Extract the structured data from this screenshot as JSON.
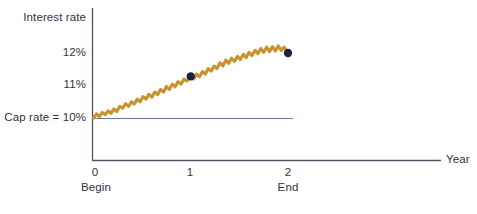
{
  "chart_data": {
    "type": "line",
    "title": "",
    "subtitle": "",
    "xlabel": "Year",
    "ylabel": "Interest rate",
    "xlim": [
      0,
      2.0
    ],
    "ylim": [
      9.4,
      12.45
    ],
    "grid": false,
    "legend_position": "none",
    "x_ticks": [
      {
        "value": 0,
        "label": "0",
        "sublabel": "Begin"
      },
      {
        "value": 1,
        "label": "1",
        "sublabel": ""
      },
      {
        "value": 2,
        "label": "2",
        "sublabel": "End"
      }
    ],
    "y_ticks": [
      {
        "value": 12,
        "label": "12%"
      },
      {
        "value": 11,
        "label": "11%"
      },
      {
        "value": 10,
        "label": "Cap rate = 10%"
      }
    ],
    "reference_lines": [
      {
        "name": "cap-rate",
        "label": "Cap rate = 10%",
        "value": 10,
        "orientation": "horizontal",
        "x_start": 0,
        "x_end": 2.05,
        "color": "#6b7a94"
      }
    ],
    "series": [
      {
        "name": "Floating interest rate",
        "color": "#c8922e",
        "values": [
          [
            0.0,
            10.0
          ],
          [
            0.03,
            10.13
          ],
          [
            0.06,
            10.04
          ],
          [
            0.09,
            10.17
          ],
          [
            0.12,
            10.1
          ],
          [
            0.15,
            10.22
          ],
          [
            0.18,
            10.14
          ],
          [
            0.21,
            10.28
          ],
          [
            0.24,
            10.2
          ],
          [
            0.27,
            10.36
          ],
          [
            0.3,
            10.3
          ],
          [
            0.33,
            10.44
          ],
          [
            0.36,
            10.36
          ],
          [
            0.39,
            10.5
          ],
          [
            0.42,
            10.43
          ],
          [
            0.45,
            10.58
          ],
          [
            0.48,
            10.5
          ],
          [
            0.51,
            10.66
          ],
          [
            0.54,
            10.58
          ],
          [
            0.57,
            10.73
          ],
          [
            0.6,
            10.64
          ],
          [
            0.63,
            10.8
          ],
          [
            0.66,
            10.72
          ],
          [
            0.69,
            10.88
          ],
          [
            0.72,
            10.8
          ],
          [
            0.75,
            10.97
          ],
          [
            0.78,
            10.88
          ],
          [
            0.81,
            11.04
          ],
          [
            0.84,
            10.96
          ],
          [
            0.87,
            11.12
          ],
          [
            0.9,
            11.04
          ],
          [
            0.93,
            11.2
          ],
          [
            0.96,
            11.14
          ],
          [
            1.0,
            11.28
          ],
          [
            1.03,
            11.2
          ],
          [
            1.06,
            11.35
          ],
          [
            1.09,
            11.27
          ],
          [
            1.12,
            11.43
          ],
          [
            1.15,
            11.35
          ],
          [
            1.18,
            11.52
          ],
          [
            1.21,
            11.44
          ],
          [
            1.24,
            11.6
          ],
          [
            1.27,
            11.52
          ],
          [
            1.3,
            11.7
          ],
          [
            1.33,
            11.6
          ],
          [
            1.36,
            11.78
          ],
          [
            1.39,
            11.68
          ],
          [
            1.42,
            11.84
          ],
          [
            1.45,
            11.74
          ],
          [
            1.48,
            11.9
          ],
          [
            1.51,
            11.8
          ],
          [
            1.54,
            11.96
          ],
          [
            1.57,
            11.86
          ],
          [
            1.6,
            12.02
          ],
          [
            1.63,
            11.92
          ],
          [
            1.66,
            12.08
          ],
          [
            1.69,
            11.98
          ],
          [
            1.72,
            12.14
          ],
          [
            1.75,
            12.02
          ],
          [
            1.78,
            12.18
          ],
          [
            1.81,
            12.04
          ],
          [
            1.84,
            12.2
          ],
          [
            1.87,
            12.06
          ],
          [
            1.9,
            12.22
          ],
          [
            1.93,
            12.08
          ],
          [
            1.96,
            12.18
          ],
          [
            2.0,
            12.0
          ]
        ]
      }
    ],
    "markers": [
      {
        "name": "rate-at-year-1",
        "x": 1.0,
        "y": 11.28,
        "color": "#1a2440",
        "radius": 4.2
      },
      {
        "name": "rate-at-year-2",
        "x": 2.0,
        "y": 12.0,
        "color": "#1a2440",
        "radius": 4.2
      }
    ],
    "axis_color": "#4e5366",
    "text_color": "#2f3342",
    "background_color": "#ffffff"
  },
  "axis": {
    "y_title": "Interest rate",
    "x_title": "Year"
  },
  "labels": {
    "y_12": "12%",
    "y_11": "11%",
    "y_cap": "Cap rate = 10%",
    "x_0": "0",
    "x_0_sub": "Begin",
    "x_1": "1",
    "x_2": "2",
    "x_2_sub": "End"
  }
}
